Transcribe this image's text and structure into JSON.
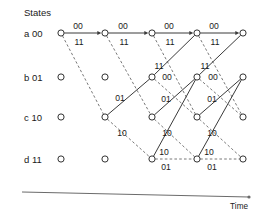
{
  "figure": {
    "title_label": "States",
    "time_axis_label": "Time",
    "type": "trellis-diagram"
  },
  "colors": {
    "background": "#ffffff",
    "node_stroke": "#333333",
    "solid_edge": "#3a3a3a",
    "dashed_edge": "#6a6a6a",
    "axis": "#6b6b6b",
    "text": "#1a1a1a"
  },
  "states": [
    {
      "id": "a",
      "label": "a 00",
      "letter": "a",
      "bits": "00",
      "y": 33
    },
    {
      "id": "b",
      "label": "b 01",
      "letter": "b",
      "bits": "01",
      "y": 77
    },
    {
      "id": "c",
      "label": "c 10",
      "letter": "c",
      "bits": "10",
      "y": 117
    },
    {
      "id": "d",
      "label": "d 11",
      "letter": "d",
      "bits": "11",
      "y": 159
    }
  ],
  "columns": [
    {
      "index": 0,
      "x": 61
    },
    {
      "index": 1,
      "x": 105
    },
    {
      "index": 2,
      "x": 152
    },
    {
      "index": 3,
      "x": 197
    },
    {
      "index": 4,
      "x": 243
    }
  ],
  "nodes": [
    {
      "state": "a",
      "col": 0,
      "x": 61,
      "y": 33
    },
    {
      "state": "a",
      "col": 1,
      "x": 105,
      "y": 33
    },
    {
      "state": "a",
      "col": 2,
      "x": 152,
      "y": 33
    },
    {
      "state": "a",
      "col": 3,
      "x": 197,
      "y": 33
    },
    {
      "state": "a",
      "col": 4,
      "x": 243,
      "y": 33
    },
    {
      "state": "b",
      "col": 0,
      "x": 61,
      "y": 77
    },
    {
      "state": "b",
      "col": 1,
      "x": 105,
      "y": 77
    },
    {
      "state": "b",
      "col": 2,
      "x": 152,
      "y": 77
    },
    {
      "state": "b",
      "col": 3,
      "x": 197,
      "y": 77
    },
    {
      "state": "b",
      "col": 4,
      "x": 243,
      "y": 77
    },
    {
      "state": "c",
      "col": 0,
      "x": 61,
      "y": 117
    },
    {
      "state": "c",
      "col": 1,
      "x": 105,
      "y": 117
    },
    {
      "state": "c",
      "col": 2,
      "x": 152,
      "y": 117
    },
    {
      "state": "c",
      "col": 3,
      "x": 197,
      "y": 117
    },
    {
      "state": "c",
      "col": 4,
      "x": 243,
      "y": 117
    },
    {
      "state": "d",
      "col": 0,
      "x": 61,
      "y": 159
    },
    {
      "state": "d",
      "col": 1,
      "x": 105,
      "y": 159
    },
    {
      "state": "d",
      "col": 2,
      "x": 152,
      "y": 159
    },
    {
      "state": "d",
      "col": 3,
      "x": 197,
      "y": 159
    },
    {
      "state": "d",
      "col": 4,
      "x": 243,
      "y": 159
    }
  ],
  "edges": [
    {
      "from": "a0",
      "to": "a1",
      "x1": 61,
      "y1": 33,
      "x2": 105,
      "y2": 33,
      "style": "solid",
      "output": "00",
      "arrow": true
    },
    {
      "from": "a0",
      "to": "c1",
      "x1": 61,
      "y1": 33,
      "x2": 105,
      "y2": 117,
      "style": "dashed",
      "output": "11",
      "arrow": false
    },
    {
      "from": "a1",
      "to": "a2",
      "x1": 105,
      "y1": 33,
      "x2": 152,
      "y2": 33,
      "style": "solid",
      "output": "00",
      "arrow": true
    },
    {
      "from": "a1",
      "to": "c2",
      "x1": 105,
      "y1": 33,
      "x2": 152,
      "y2": 117,
      "style": "dashed",
      "output": "11",
      "arrow": false
    },
    {
      "from": "c1",
      "to": "b2",
      "x1": 105,
      "y1": 117,
      "x2": 152,
      "y2": 77,
      "style": "solid",
      "output": "01",
      "arrow": false
    },
    {
      "from": "c1",
      "to": "d2",
      "x1": 105,
      "y1": 117,
      "x2": 152,
      "y2": 159,
      "style": "dashed",
      "output": "10",
      "arrow": false
    },
    {
      "from": "a2",
      "to": "a3",
      "x1": 152,
      "y1": 33,
      "x2": 197,
      "y2": 33,
      "style": "solid",
      "output": "00",
      "arrow": true
    },
    {
      "from": "a2",
      "to": "c3",
      "x1": 152,
      "y1": 33,
      "x2": 197,
      "y2": 117,
      "style": "dashed",
      "output": "11",
      "arrow": false
    },
    {
      "from": "b2",
      "to": "a3",
      "x1": 152,
      "y1": 77,
      "x2": 197,
      "y2": 33,
      "style": "solid",
      "output": "11",
      "arrow": false
    },
    {
      "from": "b2",
      "to": "c3",
      "x1": 152,
      "y1": 77,
      "x2": 197,
      "y2": 117,
      "style": "dashed",
      "output": "00",
      "arrow": false
    },
    {
      "from": "c2",
      "to": "b3",
      "x1": 152,
      "y1": 117,
      "x2": 197,
      "y2": 77,
      "style": "solid",
      "output": "01",
      "arrow": false
    },
    {
      "from": "c2",
      "to": "d3",
      "x1": 152,
      "y1": 117,
      "x2": 197,
      "y2": 159,
      "style": "dashed",
      "output": "10",
      "arrow": false
    },
    {
      "from": "d2",
      "to": "b3",
      "x1": 152,
      "y1": 159,
      "x2": 197,
      "y2": 77,
      "style": "solid",
      "output": "10",
      "arrow": false
    },
    {
      "from": "d2",
      "to": "d3",
      "x1": 152,
      "y1": 159,
      "x2": 197,
      "y2": 159,
      "style": "dashed",
      "output": "01",
      "arrow": false
    },
    {
      "from": "a3",
      "to": "a4",
      "x1": 197,
      "y1": 33,
      "x2": 243,
      "y2": 33,
      "style": "solid",
      "output": "00",
      "arrow": true
    },
    {
      "from": "a3",
      "to": "c4",
      "x1": 197,
      "y1": 33,
      "x2": 243,
      "y2": 117,
      "style": "dashed",
      "output": "11",
      "arrow": false
    },
    {
      "from": "b3",
      "to": "a4",
      "x1": 197,
      "y1": 77,
      "x2": 243,
      "y2": 33,
      "style": "solid",
      "output": "11",
      "arrow": false
    },
    {
      "from": "b3",
      "to": "c4",
      "x1": 197,
      "y1": 77,
      "x2": 243,
      "y2": 117,
      "style": "dashed",
      "output": "00",
      "arrow": false
    },
    {
      "from": "c3",
      "to": "b4",
      "x1": 197,
      "y1": 117,
      "x2": 243,
      "y2": 77,
      "style": "solid",
      "output": "01",
      "arrow": false
    },
    {
      "from": "c3",
      "to": "d4",
      "x1": 197,
      "y1": 117,
      "x2": 243,
      "y2": 159,
      "style": "dashed",
      "output": "10",
      "arrow": false
    },
    {
      "from": "d3",
      "to": "b4",
      "x1": 197,
      "y1": 159,
      "x2": 243,
      "y2": 77,
      "style": "solid",
      "output": "10",
      "arrow": false
    },
    {
      "from": "d3",
      "to": "d4",
      "x1": 197,
      "y1": 159,
      "x2": 243,
      "y2": 159,
      "style": "dashed",
      "output": "01",
      "arrow": false
    }
  ],
  "edge_labels": [
    {
      "text": "00",
      "x": 78,
      "y": 29,
      "anchor": "middle"
    },
    {
      "text": "11",
      "x": 79,
      "y": 45,
      "anchor": "middle"
    },
    {
      "text": "00",
      "x": 123,
      "y": 29,
      "anchor": "middle"
    },
    {
      "text": "11",
      "x": 124,
      "y": 45,
      "anchor": "middle"
    },
    {
      "text": "01",
      "x": 120,
      "y": 101,
      "anchor": "middle"
    },
    {
      "text": "10",
      "x": 122,
      "y": 136,
      "anchor": "middle"
    },
    {
      "text": "00",
      "x": 169,
      "y": 29,
      "anchor": "middle"
    },
    {
      "text": "11",
      "x": 170,
      "y": 45,
      "anchor": "middle"
    },
    {
      "text": "11",
      "x": 159,
      "y": 69,
      "anchor": "middle"
    },
    {
      "text": "00",
      "x": 167,
      "y": 80,
      "anchor": "middle"
    },
    {
      "text": "01",
      "x": 166,
      "y": 102,
      "anchor": "middle"
    },
    {
      "text": "10",
      "x": 167,
      "y": 136,
      "anchor": "middle"
    },
    {
      "text": "10",
      "x": 164,
      "y": 155,
      "anchor": "middle"
    },
    {
      "text": "01",
      "x": 166,
      "y": 170,
      "anchor": "middle"
    },
    {
      "text": "00",
      "x": 214,
      "y": 29,
      "anchor": "middle"
    },
    {
      "text": "11",
      "x": 215,
      "y": 45,
      "anchor": "middle"
    },
    {
      "text": "11",
      "x": 205,
      "y": 69,
      "anchor": "middle"
    },
    {
      "text": "00",
      "x": 213,
      "y": 80,
      "anchor": "middle"
    },
    {
      "text": "01",
      "x": 212,
      "y": 102,
      "anchor": "middle"
    },
    {
      "text": "10",
      "x": 212,
      "y": 136,
      "anchor": "middle"
    },
    {
      "text": "10",
      "x": 209,
      "y": 155,
      "anchor": "middle"
    },
    {
      "text": "01",
      "x": 212,
      "y": 170,
      "anchor": "middle"
    }
  ],
  "axis": {
    "x1": 22,
    "y1": 192,
    "x2": 249,
    "y2": 197,
    "label_x": 248,
    "label_y": 209
  }
}
